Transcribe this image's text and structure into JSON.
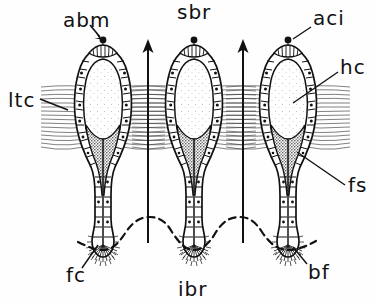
{
  "figure": {
    "kind": "hand-drawn line diagram"
  },
  "labels": {
    "top_center": "sbr",
    "top_left": "abm",
    "top_right": "aci",
    "right_upper": "hc",
    "right_lower": "fs",
    "left_middle": "ltc",
    "bottom_left": "fc",
    "bottom_right": "bf",
    "bottom_center": "ibr"
  },
  "colors": {
    "ink": "#111111",
    "paper": "#fefefe",
    "fiber": "#3a3a3a",
    "stipple": "#4a4a4a",
    "lumen": "#fbfbfb",
    "bleed": "#c9c9c9"
  },
  "structures": {
    "cell_count": 3,
    "arrow_count": 2,
    "arrow_direction": "up",
    "basal_line_style": "dashed wavy",
    "apical_dot": "apical cilium base",
    "wall_cells": "rectangular epithelial cells with nuclei dots",
    "lateral_band": "horizontal tonofibril band"
  },
  "bleed_text": "",
  "scale": {
    "width": 378,
    "height": 304
  }
}
